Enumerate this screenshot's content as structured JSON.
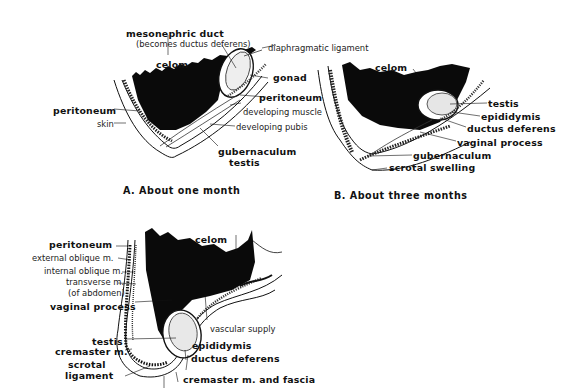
{
  "figure": {
    "panels": [
      {
        "id": "A",
        "caption": "A. About one month",
        "labels": {
          "mesonephric_duct": "mesonephric duct",
          "becomes": "(becomes ductus deferens)",
          "diaphragmatic_ligament": "diaphragmatic ligament",
          "celom": "celom",
          "gonad": "gonad",
          "peritoneum_right": "peritoneum",
          "peritoneum_left": "peritoneum",
          "developing_muscle": "developing muscle",
          "skin": "skin",
          "developing_pubis": "developing pubis",
          "gubernaculum": "gubernaculum",
          "testis": "testis"
        }
      },
      {
        "id": "B",
        "caption": "B. About three months",
        "labels": {
          "celom": "celom",
          "testis": "testis",
          "epididymis": "epididymis",
          "ductus_deferens": "ductus deferens",
          "vaginal_process": "vaginal process",
          "gubernaculum": "gubernaculum",
          "scrotal_swelling": "scrotal swelling"
        }
      },
      {
        "id": "C",
        "labels": {
          "peritoneum": "peritoneum",
          "external_oblique": "external oblique m.",
          "internal_oblique": "internal oblique m.",
          "transverse": "transverse m.",
          "of_abdomen": "(of abdomen)",
          "vaginal_process": "vaginal process",
          "celom": "celom",
          "vascular_supply": "vascular supply",
          "testis": "testis",
          "cremaster": "cremaster m.",
          "scrotal": "scrotal",
          "ligament": "ligament",
          "epididymis": "epididymis",
          "ductus_deferens": "ductus deferens",
          "cremaster_fascia": "cremaster m. and fascia"
        }
      }
    ]
  }
}
